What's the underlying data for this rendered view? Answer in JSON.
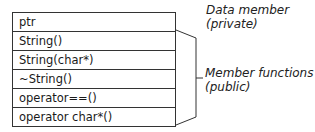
{
  "class_box": {
    "rows": [
      {
        "text": "ptr"
      },
      {
        "text": "String()"
      },
      {
        "text": "String(char*)"
      },
      {
        "text": "~String()"
      },
      {
        "text": "operator==()"
      },
      {
        "text": "operator char*()"
      }
    ]
  },
  "annotations": {
    "data_member": {
      "line1": "Data member",
      "line2": "(private)"
    },
    "member_functions": {
      "line1": "Member functions",
      "line2": "(public)"
    }
  }
}
